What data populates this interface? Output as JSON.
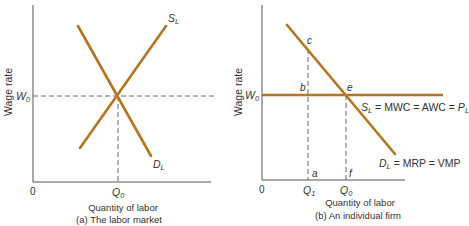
{
  "colors": {
    "curve": "#b5741f",
    "axis": "#555555",
    "dash": "#555555",
    "text": "#333333"
  },
  "panel_a": {
    "caption": "(a) The labor market",
    "x_axis_label": "Quantity of labor",
    "y_axis_label": "Wage rate",
    "origin": "0",
    "wage_label": "W",
    "wage_sub": "0",
    "quantity_label": "Q",
    "quantity_sub": "0",
    "supply_label": "S",
    "supply_sub": "L",
    "demand_label": "D",
    "demand_sub": "L"
  },
  "panel_b": {
    "caption": "(b) An individual firm",
    "x_axis_label": "Quantity of labor",
    "y_axis_label": "Wage rate",
    "origin": "0",
    "wage_label": "W",
    "wage_sub": "0",
    "q1_label": "Q",
    "q1_sub": "1",
    "q0_label": "Q",
    "q0_sub": "0",
    "supply_curve_label": {
      "s": "S",
      "s_sub": "L",
      "rest": " = MWC = AWC = ",
      "p": "P",
      "p_sub": "L"
    },
    "demand_curve_label": {
      "d": "D",
      "d_sub": "L",
      "rest": " = MRP = VMP"
    },
    "points": {
      "a": "a",
      "b": "b",
      "c": "c",
      "e": "e",
      "f": "f"
    }
  }
}
